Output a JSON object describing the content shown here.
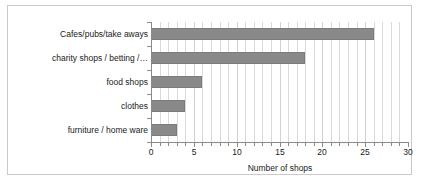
{
  "chart_data": {
    "type": "bar",
    "orientation": "horizontal",
    "title": "",
    "xlabel": "Number of shops",
    "ylabel": "",
    "categories": [
      "Cafes/pubs/take aways",
      "charity shops / betting /…",
      "food shops",
      "clothes",
      "furniture / home ware"
    ],
    "values": [
      26,
      18,
      6,
      4,
      3
    ],
    "xlim": [
      0,
      30
    ],
    "xticks": [
      0,
      5,
      10,
      15,
      20,
      25,
      30
    ],
    "xticklabels": [
      "0",
      "5",
      "10",
      "15",
      "20",
      "25",
      "30"
    ],
    "minor_tick_step": 1,
    "grid": "vertical-minor",
    "legend": null,
    "bar_color": "#898989",
    "gridline_color": "#d9d9d9",
    "axis_color": "#8a8a8a",
    "frame_color": "#c9c9c9",
    "text_color": "#1a1a1a"
  }
}
